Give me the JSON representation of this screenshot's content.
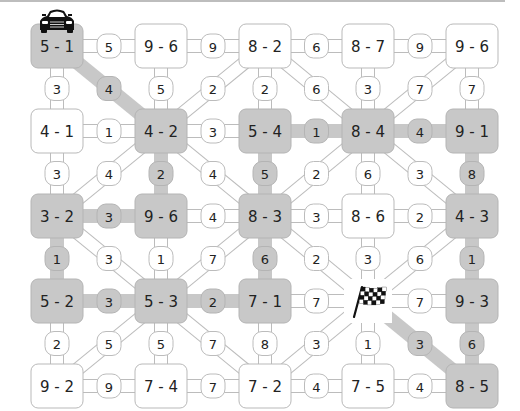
{
  "game": {
    "title": "Road Race Puzzle",
    "colors": {
      "shaded_fill": "#c8c8c8",
      "shaded_stroke": "#b4b4b4",
      "plain_fill": "#ffffff",
      "plain_stroke": "#b9b9b9",
      "road_fill": "#ffffff",
      "road_stroke": "#bcbcbc",
      "shaded_road": "#c8c8c8",
      "text": "#222222"
    },
    "start_icon": "car-icon",
    "finish_icon": "checkered-flag-icon",
    "nodes": [
      [
        "5 - 1",
        "9 - 6",
        "8 - 2",
        "8 - 7",
        "9 - 6"
      ],
      [
        "4 - 1",
        "4 - 2",
        "5 - 4",
        "8 - 4",
        "9 - 1"
      ],
      [
        "3 - 2",
        "9 - 6",
        "8 - 3",
        "8 - 6",
        "4 - 3"
      ],
      [
        "5 - 2",
        "5 - 3",
        "7 - 1",
        "FLAG",
        "9 - 3"
      ],
      [
        "9 - 2",
        "7 - 4",
        "7 - 2",
        "7 - 5",
        "8 - 5"
      ]
    ],
    "shaded_nodes": [
      [
        0,
        0
      ],
      [
        1,
        1
      ],
      [
        1,
        2
      ],
      [
        1,
        3
      ],
      [
        1,
        4
      ],
      [
        2,
        0
      ],
      [
        2,
        1
      ],
      [
        2,
        2
      ],
      [
        2,
        4
      ],
      [
        3,
        0
      ],
      [
        3,
        1
      ],
      [
        3,
        2
      ],
      [
        3,
        4
      ],
      [
        4,
        4
      ]
    ],
    "edges": [
      {
        "from": [
          0,
          0
        ],
        "to": [
          0,
          1
        ],
        "value": "5",
        "shaded": false
      },
      {
        "from": [
          0,
          1
        ],
        "to": [
          0,
          2
        ],
        "value": "9",
        "shaded": false
      },
      {
        "from": [
          0,
          2
        ],
        "to": [
          0,
          3
        ],
        "value": "6",
        "shaded": false
      },
      {
        "from": [
          0,
          3
        ],
        "to": [
          0,
          4
        ],
        "value": "9",
        "shaded": false
      },
      {
        "from": [
          1,
          0
        ],
        "to": [
          1,
          1
        ],
        "value": "1",
        "shaded": false
      },
      {
        "from": [
          1,
          1
        ],
        "to": [
          1,
          2
        ],
        "value": "3",
        "shaded": false
      },
      {
        "from": [
          1,
          2
        ],
        "to": [
          1,
          3
        ],
        "value": "1",
        "shaded": true
      },
      {
        "from": [
          1,
          3
        ],
        "to": [
          1,
          4
        ],
        "value": "4",
        "shaded": true
      },
      {
        "from": [
          2,
          0
        ],
        "to": [
          2,
          1
        ],
        "value": "3",
        "shaded": true
      },
      {
        "from": [
          2,
          1
        ],
        "to": [
          2,
          2
        ],
        "value": "4",
        "shaded": false
      },
      {
        "from": [
          2,
          2
        ],
        "to": [
          2,
          3
        ],
        "value": "3",
        "shaded": false
      },
      {
        "from": [
          2,
          3
        ],
        "to": [
          2,
          4
        ],
        "value": "2",
        "shaded": false
      },
      {
        "from": [
          3,
          0
        ],
        "to": [
          3,
          1
        ],
        "value": "3",
        "shaded": true
      },
      {
        "from": [
          3,
          1
        ],
        "to": [
          3,
          2
        ],
        "value": "2",
        "shaded": true
      },
      {
        "from": [
          3,
          2
        ],
        "to": [
          3,
          3
        ],
        "value": "7",
        "shaded": false
      },
      {
        "from": [
          3,
          3
        ],
        "to": [
          3,
          4
        ],
        "value": "7",
        "shaded": false
      },
      {
        "from": [
          4,
          0
        ],
        "to": [
          4,
          1
        ],
        "value": "9",
        "shaded": false
      },
      {
        "from": [
          4,
          1
        ],
        "to": [
          4,
          2
        ],
        "value": "7",
        "shaded": false
      },
      {
        "from": [
          4,
          2
        ],
        "to": [
          4,
          3
        ],
        "value": "4",
        "shaded": false
      },
      {
        "from": [
          4,
          3
        ],
        "to": [
          4,
          4
        ],
        "value": "4",
        "shaded": false
      },
      {
        "from": [
          0,
          0
        ],
        "to": [
          1,
          0
        ],
        "value": "3",
        "shaded": false
      },
      {
        "from": [
          0,
          1
        ],
        "to": [
          1,
          1
        ],
        "value": "5",
        "shaded": false
      },
      {
        "from": [
          0,
          2
        ],
        "to": [
          1,
          2
        ],
        "value": "2",
        "shaded": false
      },
      {
        "from": [
          0,
          3
        ],
        "to": [
          1,
          3
        ],
        "value": "3",
        "shaded": false
      },
      {
        "from": [
          0,
          4
        ],
        "to": [
          1,
          4
        ],
        "value": "7",
        "shaded": false
      },
      {
        "from": [
          1,
          0
        ],
        "to": [
          2,
          0
        ],
        "value": "3",
        "shaded": false
      },
      {
        "from": [
          1,
          1
        ],
        "to": [
          2,
          1
        ],
        "value": "2",
        "shaded": true
      },
      {
        "from": [
          1,
          2
        ],
        "to": [
          2,
          2
        ],
        "value": "5",
        "shaded": true
      },
      {
        "from": [
          1,
          3
        ],
        "to": [
          2,
          3
        ],
        "value": "6",
        "shaded": false
      },
      {
        "from": [
          1,
          4
        ],
        "to": [
          2,
          4
        ],
        "value": "8",
        "shaded": true
      },
      {
        "from": [
          2,
          0
        ],
        "to": [
          3,
          0
        ],
        "value": "1",
        "shaded": true
      },
      {
        "from": [
          2,
          1
        ],
        "to": [
          3,
          1
        ],
        "value": "1",
        "shaded": false
      },
      {
        "from": [
          2,
          2
        ],
        "to": [
          3,
          2
        ],
        "value": "6",
        "shaded": true
      },
      {
        "from": [
          2,
          3
        ],
        "to": [
          3,
          3
        ],
        "value": "3",
        "shaded": false
      },
      {
        "from": [
          2,
          4
        ],
        "to": [
          3,
          4
        ],
        "value": "1",
        "shaded": true
      },
      {
        "from": [
          3,
          0
        ],
        "to": [
          4,
          0
        ],
        "value": "2",
        "shaded": false
      },
      {
        "from": [
          3,
          1
        ],
        "to": [
          4,
          1
        ],
        "value": "5",
        "shaded": false
      },
      {
        "from": [
          3,
          2
        ],
        "to": [
          4,
          2
        ],
        "value": "8",
        "shaded": false
      },
      {
        "from": [
          3,
          3
        ],
        "to": [
          4,
          3
        ],
        "value": "1",
        "shaded": false
      },
      {
        "from": [
          3,
          4
        ],
        "to": [
          4,
          4
        ],
        "value": "6",
        "shaded": true
      },
      {
        "from": [
          0,
          0
        ],
        "to": [
          1,
          1
        ],
        "value": "4",
        "shaded": true
      },
      {
        "from": [
          0,
          2
        ],
        "to": [
          1,
          1
        ],
        "value": "2",
        "shaded": false
      },
      {
        "from": [
          0,
          2
        ],
        "to": [
          1,
          3
        ],
        "value": "6",
        "shaded": false
      },
      {
        "from": [
          0,
          4
        ],
        "to": [
          1,
          3
        ],
        "value": "7",
        "shaded": false
      },
      {
        "from": [
          1,
          1
        ],
        "to": [
          2,
          0
        ],
        "value": "4",
        "shaded": false
      },
      {
        "from": [
          1,
          1
        ],
        "to": [
          2,
          2
        ],
        "value": "4",
        "shaded": false
      },
      {
        "from": [
          1,
          3
        ],
        "to": [
          2,
          2
        ],
        "value": "2",
        "shaded": false
      },
      {
        "from": [
          1,
          3
        ],
        "to": [
          2,
          4
        ],
        "value": "3",
        "shaded": false
      },
      {
        "from": [
          2,
          0
        ],
        "to": [
          3,
          1
        ],
        "value": "3",
        "shaded": false
      },
      {
        "from": [
          2,
          2
        ],
        "to": [
          3,
          1
        ],
        "value": "7",
        "shaded": false
      },
      {
        "from": [
          2,
          2
        ],
        "to": [
          3,
          3
        ],
        "value": "2",
        "shaded": false
      },
      {
        "from": [
          2,
          4
        ],
        "to": [
          3,
          3
        ],
        "value": "6",
        "shaded": false
      },
      {
        "from": [
          3,
          1
        ],
        "to": [
          4,
          0
        ],
        "value": "5",
        "shaded": false
      },
      {
        "from": [
          3,
          1
        ],
        "to": [
          4,
          2
        ],
        "value": "7",
        "shaded": false
      },
      {
        "from": [
          3,
          3
        ],
        "to": [
          4,
          2
        ],
        "value": "3",
        "shaded": false
      },
      {
        "from": [
          3,
          3
        ],
        "to": [
          4,
          4
        ],
        "value": "3",
        "shaded": true
      }
    ]
  }
}
